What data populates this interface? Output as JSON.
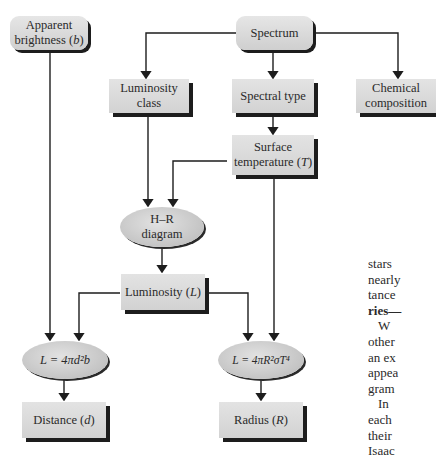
{
  "diagram": {
    "nodes": {
      "apparent_brightness": {
        "line1": "Apparent",
        "line2": "brightness (",
        "var": "b",
        "close": ")"
      },
      "spectrum": {
        "label": "Spectrum"
      },
      "luminosity_class": {
        "line1": "Luminosity",
        "line2": "class"
      },
      "spectral_type": {
        "label": "Spectral type"
      },
      "chemical_composition": {
        "line1": "Chemical",
        "line2": "composition"
      },
      "surface_temperature": {
        "line1": "Surface",
        "line2": "temperature (",
        "var": "T",
        "close": ")"
      },
      "hr_diagram": {
        "line1": "H–R",
        "line2": "diagram"
      },
      "luminosity": {
        "prefix": "Luminosity (",
        "var": "L",
        "close": ")"
      },
      "distance_formula": {
        "label": "L = 4πd²b"
      },
      "radius_formula": {
        "label": "L = 4πR²σT⁴"
      },
      "distance": {
        "prefix": "Distance (",
        "var": "d",
        "close": ")"
      },
      "radius": {
        "prefix": "Radius (",
        "var": "R",
        "close": ")"
      }
    },
    "edges": [
      [
        "Spectrum",
        "Luminosity class"
      ],
      [
        "Spectrum",
        "Spectral type"
      ],
      [
        "Spectrum",
        "Chemical composition"
      ],
      [
        "Spectral type",
        "Surface temperature (T)"
      ],
      [
        "Luminosity class",
        "H–R diagram"
      ],
      [
        "Surface temperature (T)",
        "H–R diagram"
      ],
      [
        "H–R diagram",
        "Luminosity (L)"
      ],
      [
        "Apparent brightness (b)",
        "L = 4πd²b"
      ],
      [
        "Luminosity (L)",
        "L = 4πd²b"
      ],
      [
        "Luminosity (L)",
        "L = 4πR²σT⁴"
      ],
      [
        "Surface temperature (T)",
        "L = 4πR²σT⁴"
      ],
      [
        "L = 4πd²b",
        "Distance (d)"
      ],
      [
        "L = 4πR²σT⁴",
        "Radius (R)"
      ]
    ]
  },
  "side_text": {
    "lines": [
      "stars",
      "nearly",
      "tance",
      "ries—",
      "W",
      "other",
      "an ex",
      "appea",
      "gram",
      "In",
      "each",
      "their",
      "Isaac"
    ]
  }
}
